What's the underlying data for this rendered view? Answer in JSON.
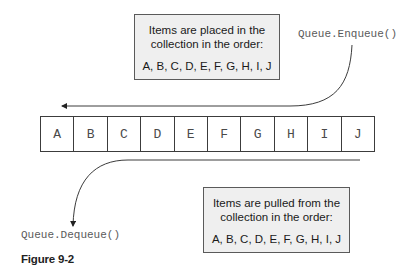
{
  "diagram": {
    "enqueue_note": {
      "line1": "Items are placed in the",
      "line2": "collection in the order:",
      "order": "A, B, C, D, E, F, G, H, I, J"
    },
    "enqueue_label": "Queue.Enqueue()",
    "queue_items": [
      "A",
      "B",
      "C",
      "D",
      "E",
      "F",
      "G",
      "H",
      "I",
      "J"
    ],
    "dequeue_note": {
      "line1": "Items are pulled from the",
      "line2": "collection in the order:",
      "order": "A, B, C, D, E, F, G, H, I, J"
    },
    "dequeue_label": "Queue.Dequeue()",
    "caption": "Figure 9-2"
  },
  "colors": {
    "box_background": "#efefef",
    "box_border": "#5a5a5a",
    "line": "#3c3c3c",
    "code_text": "#5a5a5a"
  }
}
